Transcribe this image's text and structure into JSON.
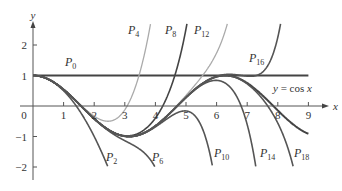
{
  "chart_data": {
    "type": "line",
    "title": "",
    "xlabel": "x",
    "ylabel": "y",
    "xlim": [
      0,
      9.4
    ],
    "ylim": [
      -2,
      2.7
    ],
    "grid": false,
    "x_ticks": [
      0,
      1,
      2,
      3,
      4,
      5,
      6,
      7,
      8,
      9
    ],
    "y_ticks": [
      -2,
      -1,
      1,
      2
    ],
    "x_tick_labels": [
      "0",
      "1",
      "2",
      "3",
      "4",
      "5",
      "6",
      "7",
      "8",
      "9"
    ],
    "y_tick_labels": [
      "−2",
      "−1",
      "1",
      "2"
    ],
    "function_label": "y = cos x",
    "series": [
      {
        "name": "y = cos x",
        "kind": "cos",
        "color": "#444444",
        "width": 2,
        "x_range": [
          0,
          9
        ],
        "label_pos": [
          273,
          92
        ]
      },
      {
        "name": "P0",
        "kind": "taylor",
        "degree": 0,
        "color": "#444444",
        "width": 2.2,
        "x_range": [
          0,
          9
        ],
        "label_pos": [
          65,
          66
        ],
        "sub": "0"
      },
      {
        "name": "P2",
        "kind": "taylor",
        "degree": 2,
        "color": "#555555",
        "width": 1.6,
        "x_range": [
          0,
          9
        ],
        "label_pos": [
          106,
          161
        ],
        "sub": "2"
      },
      {
        "name": "P4",
        "kind": "taylor",
        "degree": 4,
        "color": "#aaaaaa",
        "width": 1.3,
        "x_range": [
          0,
          9
        ],
        "label_pos": [
          128,
          34
        ],
        "sub": "4"
      },
      {
        "name": "P6",
        "kind": "taylor",
        "degree": 6,
        "color": "#555555",
        "width": 1.6,
        "x_range": [
          0,
          9
        ],
        "label_pos": [
          152,
          161
        ],
        "sub": "6"
      },
      {
        "name": "P8",
        "kind": "taylor",
        "degree": 8,
        "color": "#444444",
        "width": 1.6,
        "x_range": [
          0,
          9
        ],
        "label_pos": [
          165,
          34
        ],
        "sub": "8"
      },
      {
        "name": "P10",
        "kind": "taylor",
        "degree": 10,
        "color": "#555555",
        "width": 1.6,
        "x_range": [
          0,
          9
        ],
        "label_pos": [
          214,
          157
        ],
        "sub": "10"
      },
      {
        "name": "P12",
        "kind": "taylor",
        "degree": 12,
        "color": "#aaaaaa",
        "width": 1.3,
        "x_range": [
          0,
          9
        ],
        "label_pos": [
          194,
          34
        ],
        "sub": "12"
      },
      {
        "name": "P14",
        "kind": "taylor",
        "degree": 14,
        "color": "#555555",
        "width": 1.6,
        "x_range": [
          0,
          9
        ],
        "label_pos": [
          260,
          157
        ],
        "sub": "14"
      },
      {
        "name": "P16",
        "kind": "taylor",
        "degree": 16,
        "color": "#555555",
        "width": 1.6,
        "x_range": [
          0,
          9
        ],
        "label_pos": [
          249,
          62
        ],
        "sub": "16"
      },
      {
        "name": "P18",
        "kind": "taylor",
        "degree": 18,
        "color": "#555555",
        "width": 1.6,
        "x_range": [
          0,
          9
        ],
        "label_pos": [
          294,
          157
        ],
        "sub": "18"
      }
    ]
  }
}
